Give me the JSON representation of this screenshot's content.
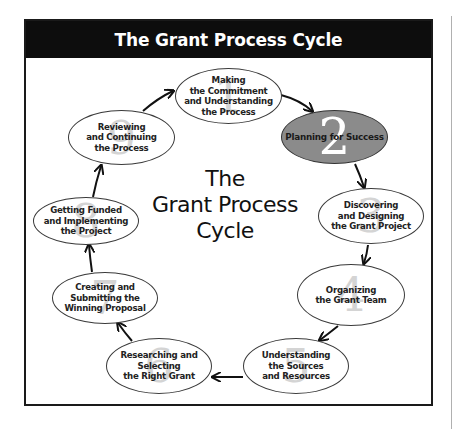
{
  "diagram": {
    "title": "The Grant Process Cycle",
    "center_label": "The\nGrant Process\nCycle",
    "colors": {
      "header_bg": "#0d0d0d",
      "header_text": "#ffffff",
      "active_fill": "#8b8b8b",
      "node_fill": "#ffffff",
      "watermark_numeral": "#d4d4d4"
    },
    "active_step": 2,
    "steps": [
      {
        "number": "1",
        "label": "Making\nthe Commitment\nand Understanding\nthe Process"
      },
      {
        "number": "2",
        "label": "Planning for Success"
      },
      {
        "number": "3",
        "label": "Discovering\nand Designing\nthe Grant Project"
      },
      {
        "number": "4",
        "label": "Organizing\nthe Grant Team"
      },
      {
        "number": "5",
        "label": "Understanding\nthe Sources\nand Resources"
      },
      {
        "number": "6",
        "label": "Researching and\nSelecting\nthe Right Grant"
      },
      {
        "number": "7",
        "label": "Creating and\nSubmitting the\nWinning Proposal"
      },
      {
        "number": "8",
        "label": "Getting Funded\nand Implementing\nthe Project"
      },
      {
        "number": "9",
        "label": "Reviewing\nand Continuing\nthe Process"
      }
    ],
    "flow": [
      [
        "1",
        "2"
      ],
      [
        "2",
        "3"
      ],
      [
        "3",
        "4"
      ],
      [
        "4",
        "5"
      ],
      [
        "5",
        "6"
      ],
      [
        "6",
        "7"
      ],
      [
        "7",
        "8"
      ],
      [
        "8",
        "9"
      ],
      [
        "9",
        "1"
      ]
    ]
  }
}
